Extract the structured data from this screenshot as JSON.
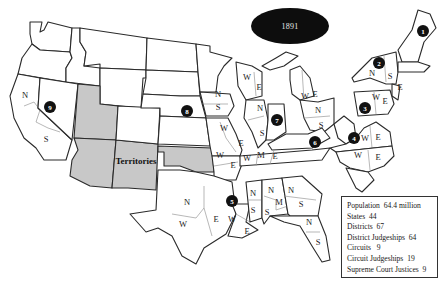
{
  "title": {
    "year": "1891"
  },
  "territories_label": "Territories",
  "circuits": [
    {
      "number": "1",
      "x": 423,
      "y": 31
    },
    {
      "number": "2",
      "x": 379,
      "y": 63
    },
    {
      "number": "3",
      "x": 365,
      "y": 108
    },
    {
      "number": "4",
      "x": 354,
      "y": 138
    },
    {
      "number": "5",
      "x": 232,
      "y": 201
    },
    {
      "number": "6",
      "x": 315,
      "y": 142
    },
    {
      "number": "7",
      "x": 277,
      "y": 120
    },
    {
      "number": "8",
      "x": 187,
      "y": 111
    },
    {
      "number": "9",
      "x": 50,
      "y": 107
    }
  ],
  "district_labels": [
    {
      "t": "N",
      "x": 25,
      "y": 98
    },
    {
      "t": "S",
      "x": 46,
      "y": 142
    },
    {
      "t": "N",
      "x": 218,
      "y": 97
    },
    {
      "t": "S",
      "x": 218,
      "y": 110
    },
    {
      "t": "W",
      "x": 224,
      "y": 131
    },
    {
      "t": "E",
      "x": 241,
      "y": 146
    },
    {
      "t": "W",
      "x": 220,
      "y": 158
    },
    {
      "t": "E",
      "x": 233,
      "y": 168
    },
    {
      "t": "W",
      "x": 247,
      "y": 80
    },
    {
      "t": "E",
      "x": 259,
      "y": 90
    },
    {
      "t": "N",
      "x": 260,
      "y": 111
    },
    {
      "t": "S",
      "x": 262,
      "y": 136
    },
    {
      "t": "W",
      "x": 305,
      "y": 99
    },
    {
      "t": "E",
      "x": 315,
      "y": 97
    },
    {
      "t": "N",
      "x": 318,
      "y": 113
    },
    {
      "t": "S",
      "x": 321,
      "y": 128
    },
    {
      "t": "W",
      "x": 247,
      "y": 161
    },
    {
      "t": "M",
      "x": 261,
      "y": 158
    },
    {
      "t": "E",
      "x": 275,
      "y": 159
    },
    {
      "t": "N",
      "x": 372,
      "y": 76
    },
    {
      "t": "S",
      "x": 390,
      "y": 79
    },
    {
      "t": "E",
      "x": 400,
      "y": 90
    },
    {
      "t": "W",
      "x": 376,
      "y": 100
    },
    {
      "t": "E",
      "x": 385,
      "y": 104
    },
    {
      "t": "W",
      "x": 365,
      "y": 141
    },
    {
      "t": "E",
      "x": 378,
      "y": 140
    },
    {
      "t": "W",
      "x": 358,
      "y": 158
    },
    {
      "t": "E",
      "x": 378,
      "y": 160
    },
    {
      "t": "N",
      "x": 187,
      "y": 205
    },
    {
      "t": "W",
      "x": 183,
      "y": 227
    },
    {
      "t": "E",
      "x": 216,
      "y": 222
    },
    {
      "t": "W",
      "x": 232,
      "y": 222
    },
    {
      "t": "E",
      "x": 247,
      "y": 234
    },
    {
      "t": "N",
      "x": 253,
      "y": 196
    },
    {
      "t": "S",
      "x": 253,
      "y": 213
    },
    {
      "t": "N",
      "x": 271,
      "y": 193
    },
    {
      "t": "S",
      "x": 267,
      "y": 215
    },
    {
      "t": "M",
      "x": 279,
      "y": 205
    },
    {
      "t": "N",
      "x": 291,
      "y": 193
    },
    {
      "t": "S",
      "x": 301,
      "y": 207
    },
    {
      "t": "N",
      "x": 309,
      "y": 225
    },
    {
      "t": "S",
      "x": 318,
      "y": 245
    }
  ],
  "stats": [
    {
      "label": "Population",
      "value": "64.4 million"
    },
    {
      "label": "States",
      "value": "44"
    },
    {
      "label": "Districts",
      "value": "67"
    },
    {
      "label": "District Judgeships",
      "value": "64"
    },
    {
      "label": "Circuits",
      "value": "9"
    },
    {
      "label": "Circuit Judgeships",
      "value": "19"
    },
    {
      "label": "Supreme Court Justices",
      "value": "9"
    }
  ],
  "colors": {
    "territory_fill": "#c8c8c8",
    "state_fill": "#ffffff",
    "circuit_marker": "#111111",
    "border": "#2a2a2a"
  }
}
